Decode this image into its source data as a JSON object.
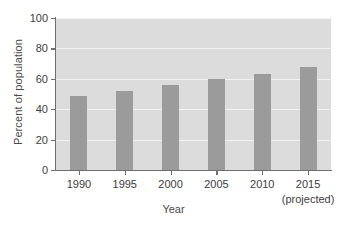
{
  "chart_data": {
    "type": "bar",
    "title": "",
    "xlabel": "Year",
    "ylabel": "Percent of population",
    "categories": [
      "1990",
      "1995",
      "2000",
      "2005",
      "2010",
      "2015"
    ],
    "category_sublabels": [
      "",
      "",
      "",
      "",
      "",
      "(projected)"
    ],
    "values": [
      49,
      52,
      56,
      60,
      63,
      67.5
    ],
    "ylim": [
      0,
      100
    ],
    "yticks": [
      0,
      20,
      40,
      60,
      80,
      100
    ],
    "ytick_labels": [
      "0",
      "20",
      "40",
      "60",
      "80",
      "100"
    ],
    "grid": true,
    "legend": "none",
    "bar_color": "#9b9b9b",
    "plot_background": "#dcdcdc",
    "gridline_color": "#f2f2f2",
    "axis_color": "#6f6f6f"
  }
}
